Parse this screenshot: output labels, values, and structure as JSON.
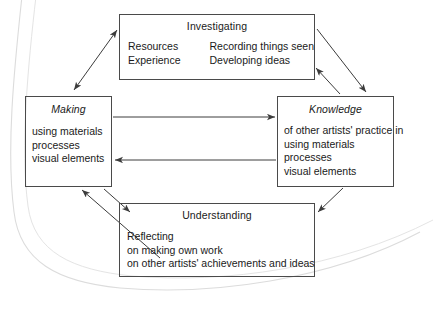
{
  "diagram": {
    "type": "cycle-flow-diagram",
    "boxes": [
      {
        "id": "investigating",
        "title": "Investigating",
        "title_style": "regular",
        "columns": [
          [
            "Resources",
            "Experience"
          ],
          [
            "Recording things seen",
            "Developing ideas"
          ]
        ]
      },
      {
        "id": "making",
        "title": "Making",
        "title_style": "italic",
        "lines": [
          "using materials",
          "processes",
          "visual elements"
        ]
      },
      {
        "id": "knowledge",
        "title": "Knowledge",
        "title_style": "italic",
        "lines": [
          "of other artists' practice in",
          "using materials",
          "processes",
          "visual elements"
        ]
      },
      {
        "id": "understanding",
        "title": "Understanding",
        "title_style": "regular",
        "lines": [
          "Reflecting",
          "on making own work",
          "on other artists' achievements and ideas"
        ]
      }
    ],
    "connections": [
      {
        "from": "investigating",
        "to": "making",
        "style": "double-headed",
        "direction": "diagonal-down-left"
      },
      {
        "from": "investigating",
        "to": "knowledge",
        "style": "single",
        "direction": "diagonal-down-right"
      },
      {
        "from": "knowledge",
        "to": "investigating",
        "style": "single",
        "direction": "diagonal-up-left"
      },
      {
        "from": "making",
        "to": "knowledge",
        "style": "single",
        "direction": "horizontal-right"
      },
      {
        "from": "knowledge",
        "to": "making",
        "style": "single",
        "direction": "horizontal-left"
      },
      {
        "from": "making",
        "to": "understanding",
        "style": "single",
        "direction": "diagonal-down-right"
      },
      {
        "from": "understanding",
        "to": "making",
        "style": "single",
        "direction": "diagonal-up-left"
      },
      {
        "from": "knowledge",
        "to": "understanding",
        "style": "single",
        "direction": "diagonal-down-left"
      }
    ],
    "colors": {
      "box_border": "#4a4a4a",
      "arrow": "#3c3c3c",
      "text": "#1a1a1a",
      "page_edge": "#d8d8d8",
      "background": "#ffffff"
    }
  }
}
